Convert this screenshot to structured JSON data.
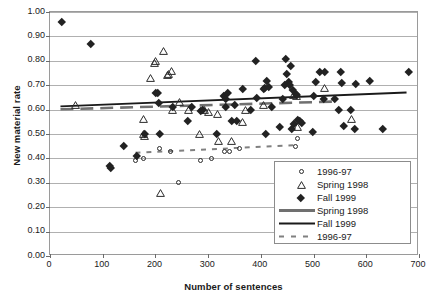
{
  "chart_data": {
    "type": "scatter",
    "title": "",
    "xlabel": "Number of sentences",
    "ylabel": "New material rate",
    "xlim": [
      0,
      700
    ],
    "ylim": [
      0.0,
      1.0
    ],
    "xticks": [
      0,
      100,
      200,
      300,
      400,
      500,
      600,
      700
    ],
    "yticks": [
      "0.00",
      "0.10",
      "0.20",
      "0.30",
      "0.40",
      "0.50",
      "0.60",
      "0.70",
      "0.80",
      "0.90",
      "1.00"
    ],
    "grid": "horizontal",
    "legend_position": "inside-lower-right",
    "legend_entries": [
      {
        "label": "1996-97",
        "kind": "marker",
        "marker": "open-circle",
        "color": "#222222"
      },
      {
        "label": "Spring 1998",
        "kind": "marker",
        "marker": "open-triangle",
        "color": "#222222"
      },
      {
        "label": "Fall 1999",
        "kind": "marker",
        "marker": "filled-diamond",
        "color": "#222222"
      },
      {
        "label": "Spring 1998",
        "kind": "line",
        "style": "dashed-thick",
        "color": "#707070"
      },
      {
        "label": "Fall 1999",
        "kind": "line",
        "style": "solid",
        "color": "#1a1a1a"
      },
      {
        "label": "1996-97",
        "kind": "line",
        "style": "dashed-thin",
        "color": "#808080"
      }
    ],
    "series": [
      {
        "name": "1996-97",
        "marker": "open-circle",
        "points": [
          [
            163,
            0.39
          ],
          [
            178,
            0.4
          ],
          [
            208,
            0.44
          ],
          [
            228,
            0.43
          ],
          [
            243,
            0.3
          ],
          [
            286,
            0.39
          ],
          [
            306,
            0.4
          ],
          [
            331,
            0.43
          ],
          [
            340,
            0.43
          ],
          [
            360,
            0.44
          ],
          [
            466,
            0.45
          ],
          [
            470,
            0.48
          ]
        ]
      },
      {
        "name": "Spring 1998",
        "marker": "open-triangle",
        "points": [
          [
            48,
            0.62
          ],
          [
            178,
            0.56
          ],
          [
            178,
            0.5
          ],
          [
            180,
            0.49
          ],
          [
            190,
            0.73
          ],
          [
            198,
            0.79
          ],
          [
            201,
            0.8
          ],
          [
            210,
            0.26
          ],
          [
            215,
            0.84
          ],
          [
            222,
            0.74
          ],
          [
            225,
            0.745
          ],
          [
            230,
            0.76
          ],
          [
            232,
            0.6
          ],
          [
            245,
            0.63
          ],
          [
            262,
            0.6
          ],
          [
            283,
            0.5
          ],
          [
            293,
            0.6
          ],
          [
            300,
            0.59
          ],
          [
            317,
            0.58
          ],
          [
            320,
            0.47
          ],
          [
            345,
            0.47
          ],
          [
            366,
            0.55
          ],
          [
            370,
            0.6
          ],
          [
            405,
            0.62
          ],
          [
            462,
            0.66
          ],
          [
            468,
            0.655
          ],
          [
            470,
            0.53
          ],
          [
            520,
            0.69
          ],
          [
            572,
            0.56
          ]
        ]
      },
      {
        "name": "Fall 1999",
        "marker": "filled-diamond",
        "points": [
          [
            22,
            0.96
          ],
          [
            78,
            0.87
          ],
          [
            113,
            0.37
          ],
          [
            116,
            0.36
          ],
          [
            139,
            0.45
          ],
          [
            164,
            0.41
          ],
          [
            180,
            0.5
          ],
          [
            200,
            0.67
          ],
          [
            205,
            0.67
          ],
          [
            207,
            0.63
          ],
          [
            208,
            0.5
          ],
          [
            233,
            0.61
          ],
          [
            262,
            0.555
          ],
          [
            268,
            0.61
          ],
          [
            286,
            0.595
          ],
          [
            290,
            0.6
          ],
          [
            316,
            0.5
          ],
          [
            330,
            0.655
          ],
          [
            333,
            0.645
          ],
          [
            334,
            0.61
          ],
          [
            337,
            0.67
          ],
          [
            345,
            0.555
          ],
          [
            350,
            0.62
          ],
          [
            355,
            0.555
          ],
          [
            366,
            0.685
          ],
          [
            380,
            0.6
          ],
          [
            390,
            0.8
          ],
          [
            392,
            0.65
          ],
          [
            405,
            0.685
          ],
          [
            407,
            0.69
          ],
          [
            409,
            0.5
          ],
          [
            412,
            0.72
          ],
          [
            415,
            0.695
          ],
          [
            420,
            0.61
          ],
          [
            436,
            0.53
          ],
          [
            442,
            0.645
          ],
          [
            446,
            0.7
          ],
          [
            448,
            0.81
          ],
          [
            450,
            0.745
          ],
          [
            452,
            0.715
          ],
          [
            454,
            0.7
          ],
          [
            456,
            0.78
          ],
          [
            458,
            0.52
          ],
          [
            460,
            0.68
          ],
          [
            462,
            0.54
          ],
          [
            466,
            0.665
          ],
          [
            468,
            0.66
          ],
          [
            470,
            0.56
          ],
          [
            474,
            0.555
          ],
          [
            478,
            0.545
          ],
          [
            498,
            0.51
          ],
          [
            500,
            0.655
          ],
          [
            505,
            0.715
          ],
          [
            512,
            0.755
          ],
          [
            520,
            0.645
          ],
          [
            522,
            0.755
          ],
          [
            540,
            0.645
          ],
          [
            548,
            0.6
          ],
          [
            552,
            0.755
          ],
          [
            553,
            0.71
          ],
          [
            558,
            0.535
          ],
          [
            570,
            0.6
          ],
          [
            578,
            0.52
          ],
          [
            580,
            0.705
          ],
          [
            606,
            0.72
          ],
          [
            632,
            0.52
          ],
          [
            680,
            0.755
          ]
        ]
      }
    ],
    "trendlines": [
      {
        "name": "Spring 1998",
        "style": "dashed-thick",
        "color": "#707070",
        "x0": 20,
        "y0": 0.598,
        "x1": 545,
        "y1": 0.63
      },
      {
        "name": "Fall 1999",
        "style": "solid",
        "color": "#1a1a1a",
        "x0": 20,
        "y0": 0.61,
        "x1": 680,
        "y1": 0.667
      },
      {
        "name": "1996-97",
        "style": "dashed-thin",
        "color": "#808080",
        "x0": 163,
        "y0": 0.418,
        "x1": 470,
        "y1": 0.45
      }
    ]
  },
  "axes": {
    "y_title": "New material rate",
    "x_title": "Number of sentences"
  }
}
